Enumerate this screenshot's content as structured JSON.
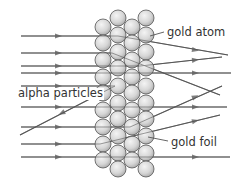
{
  "diagram": {
    "title": "",
    "labels": {
      "gold_atom": "gold atom",
      "alpha_particles": "alpha particles",
      "gold_foil": "gold foil"
    },
    "colors": {
      "line": "#555555",
      "atom_fill_center": "#f4f4f4",
      "atom_fill_edge": "#a8a8a8",
      "atom_stroke": "#555555",
      "text": "#333333"
    },
    "foil": {
      "atom_radius": 8,
      "columns": [
        {
          "x": 103,
          "ys": [
            27,
            43,
            60,
            77,
            93,
            110,
            127,
            144,
            160
          ]
        },
        {
          "x": 118,
          "ys": [
            18,
            35,
            52,
            68,
            86,
            103,
            119,
            136,
            153,
            169
          ]
        },
        {
          "x": 132,
          "ys": [
            27,
            43,
            60,
            77,
            93,
            110,
            127,
            144,
            160
          ]
        },
        {
          "x": 146,
          "ys": [
            18,
            35,
            52,
            68,
            86,
            103,
            119,
            136,
            153,
            169
          ]
        }
      ]
    },
    "alpha_paths": [
      {
        "name": "deflected-down-1",
        "points": [
          [
            21,
            36
          ],
          [
            118,
            36
          ],
          [
            228,
            55
          ]
        ],
        "arrows": [
          [
            58,
            36
          ],
          [
            195,
            50
          ]
        ]
      },
      {
        "name": "deflected-down-2",
        "points": [
          [
            21,
            53
          ],
          [
            112,
            53
          ],
          [
            220,
            95
          ]
        ],
        "arrows": [
          [
            58,
            53
          ]
        ]
      },
      {
        "name": "deflected-up-1",
        "points": [
          [
            21,
            66
          ],
          [
            140,
            66
          ],
          [
            222,
            57
          ]
        ],
        "arrows": [
          [
            58,
            66
          ],
          [
            195,
            60
          ]
        ]
      },
      {
        "name": "straight-1",
        "points": [
          [
            21,
            73
          ],
          [
            231,
            73
          ]
        ],
        "arrows": [
          [
            58,
            73
          ],
          [
            195,
            73
          ]
        ]
      },
      {
        "name": "backscattered",
        "points": [
          [
            21,
            86
          ],
          [
            115,
            86
          ],
          [
            20,
            135
          ]
        ],
        "arrows": [
          [
            58,
            86
          ],
          [
            62,
            113
          ]
        ],
        "reverse_second_arrow": true
      },
      {
        "name": "straight-2",
        "points": [
          [
            21,
            107
          ],
          [
            227,
            107
          ]
        ],
        "arrows": [
          [
            58,
            107
          ],
          [
            195,
            107
          ]
        ]
      },
      {
        "name": "deflected-up-2",
        "points": [
          [
            21,
            127
          ],
          [
            130,
            127
          ],
          [
            222,
            86
          ]
        ],
        "arrows": [
          [
            58,
            127
          ],
          [
            195,
            97
          ]
        ]
      },
      {
        "name": "deflected-up-3",
        "points": [
          [
            21,
            144
          ],
          [
            100,
            144
          ],
          [
            220,
            115
          ]
        ],
        "arrows": [
          [
            58,
            144
          ],
          [
            195,
            121
          ]
        ]
      },
      {
        "name": "straight-3",
        "points": [
          [
            21,
            157
          ],
          [
            230,
            157
          ]
        ],
        "arrows": [
          [
            58,
            157
          ],
          [
            195,
            157
          ]
        ]
      }
    ],
    "leaders": {
      "gold_atom": [
        [
          150,
          36
        ],
        [
          164,
          32
        ]
      ],
      "gold_foil": [
        [
          148,
          137
        ],
        [
          168,
          141
        ]
      ]
    }
  }
}
